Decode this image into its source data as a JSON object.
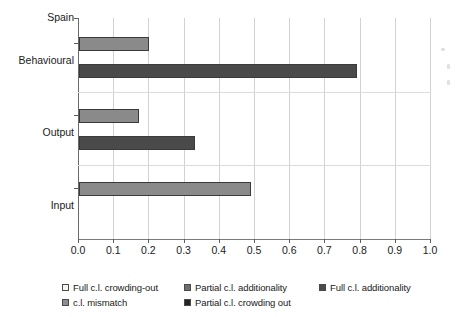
{
  "chart_data": {
    "type": "bar",
    "orientation": "horizontal",
    "title": "Spain",
    "xlabel": "",
    "ylabel": "",
    "xlim": [
      0.0,
      1.0
    ],
    "grid": true,
    "legend_position": "bottom",
    "categories": [
      "Behavioural",
      "Output",
      "Input"
    ],
    "x_ticks": [
      "0.0",
      "0.1",
      "0.2",
      "0.3",
      "0.4",
      "0.5",
      "0.6",
      "0.7",
      "0.8",
      "0.9",
      "1.0"
    ],
    "x_tick_values": [
      0.0,
      0.1,
      0.2,
      0.3,
      0.4,
      0.5,
      0.6,
      0.7,
      0.8,
      0.9,
      1.0
    ],
    "series": [
      {
        "name": "Full c.l. crowding-out",
        "color": "#f2f2f2",
        "values": [
          null,
          null,
          null
        ]
      },
      {
        "name": "Partial c.l. additionality",
        "color": "#6e6e6e",
        "values": [
          null,
          null,
          null
        ]
      },
      {
        "name": "Full c.l. additionality",
        "color": "#4a4a4a",
        "values": [
          0.79,
          0.33,
          null
        ]
      },
      {
        "name": "c.l. mismatch",
        "color": "#8a8a8a",
        "values": [
          0.2,
          0.17,
          0.49
        ]
      },
      {
        "name": "Partial c.l. crowding out",
        "color": "#2b2b2b",
        "values": [
          null,
          null,
          null
        ]
      }
    ],
    "bars": [
      {
        "category": "Behavioural",
        "series": "c.l. mismatch",
        "value": 0.2,
        "color": "#8a8a8a"
      },
      {
        "category": "Behavioural",
        "series": "Full c.l. additionality",
        "value": 0.79,
        "color": "#4a4a4a"
      },
      {
        "category": "Output",
        "series": "c.l. mismatch",
        "value": 0.17,
        "color": "#8a8a8a"
      },
      {
        "category": "Output",
        "series": "Full c.l. additionality",
        "value": 0.33,
        "color": "#4a4a4a"
      },
      {
        "category": "Input",
        "series": "c.l. mismatch",
        "value": 0.49,
        "color": "#8a8a8a"
      }
    ]
  },
  "legend": {
    "items": [
      {
        "label": "Full c.l. crowding-out",
        "color": "#f4f4f4"
      },
      {
        "label": "Partial c.l. additionality",
        "color": "#6e6e6e"
      },
      {
        "label": "Full c.l. additionality",
        "color": "#4a4a4a"
      },
      {
        "label": "c.l. mismatch",
        "color": "#8e8e8e"
      },
      {
        "label": "Partial c.l. crowding out",
        "color": "#242424"
      }
    ]
  },
  "axis": {
    "category_labels": [
      "Spain",
      "Behavioural",
      "Output",
      "Input"
    ]
  }
}
